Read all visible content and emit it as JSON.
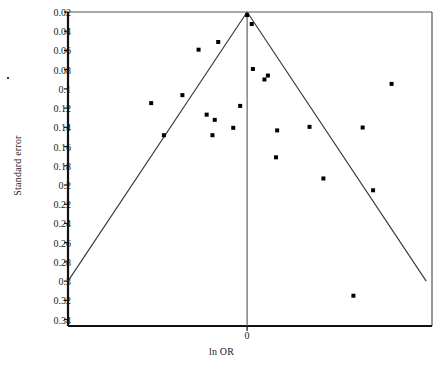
{
  "chart_data": {
    "type": "scatter",
    "title": "",
    "xlabel": "ln OR",
    "ylabel": "Standard error",
    "xlim": [
      -1.55,
      1.6
    ],
    "ylim": [
      0.02,
      0.3467
    ],
    "y_inverted": true,
    "grid": false,
    "legend": null,
    "xticks": [
      {
        "value": 0,
        "label": "0"
      }
    ],
    "yticks": [
      {
        "value": 0.02,
        "label": "0.02"
      },
      {
        "value": 0.04,
        "label": "0.04"
      },
      {
        "value": 0.06,
        "label": "0.06"
      },
      {
        "value": 0.08,
        "label": "0.08"
      },
      {
        "value": 0.1,
        "label": "0.1"
      },
      {
        "value": 0.12,
        "label": "0.12"
      },
      {
        "value": 0.14,
        "label": "0.14"
      },
      {
        "value": 0.16,
        "label": "0.16"
      },
      {
        "value": 0.18,
        "label": "0.18"
      },
      {
        "value": 0.2,
        "label": "0.2"
      },
      {
        "value": 0.22,
        "label": "0.22"
      },
      {
        "value": 0.24,
        "label": "0.24"
      },
      {
        "value": 0.26,
        "label": "0.26"
      },
      {
        "value": 0.28,
        "label": "0.28"
      },
      {
        "value": 0.3,
        "label": "0.3"
      },
      {
        "value": 0.32,
        "label": "0.32"
      },
      {
        "value": 0.34,
        "label": "0.34"
      }
    ],
    "reference_line": {
      "x": 0,
      "label": "0",
      "color": "#555555"
    },
    "funnel_bounds": {
      "apex": {
        "x": 0,
        "y": 0.02
      },
      "left_end": {
        "x": -1.55,
        "y": 0.3
      },
      "right_end": {
        "x": 1.55,
        "y": 0.3
      },
      "color": "#333333"
    },
    "marker": {
      "shape": "square",
      "color": "#000000",
      "size_px": 4
    },
    "points": [
      {
        "x": 0.0,
        "y": 0.0232
      },
      {
        "x": 0.04,
        "y": 0.0325
      },
      {
        "x": -0.25,
        "y": 0.0512
      },
      {
        "x": -0.42,
        "y": 0.0592
      },
      {
        "x": 0.05,
        "y": 0.0793
      },
      {
        "x": 0.18,
        "y": 0.0861
      },
      {
        "x": 0.15,
        "y": 0.0902
      },
      {
        "x": 1.25,
        "y": 0.0948
      },
      {
        "x": -0.56,
        "y": 0.1065
      },
      {
        "x": -0.83,
        "y": 0.1148
      },
      {
        "x": -0.06,
        "y": 0.1177
      },
      {
        "x": -0.35,
        "y": 0.1268
      },
      {
        "x": -0.28,
        "y": 0.1322
      },
      {
        "x": -0.12,
        "y": 0.1405
      },
      {
        "x": 0.26,
        "y": 0.1432
      },
      {
        "x": 0.54,
        "y": 0.1395
      },
      {
        "x": 1.0,
        "y": 0.1402
      },
      {
        "x": -0.72,
        "y": 0.1482
      },
      {
        "x": -0.3,
        "y": 0.1482
      },
      {
        "x": 0.25,
        "y": 0.1712
      },
      {
        "x": 0.66,
        "y": 0.1932
      },
      {
        "x": 1.09,
        "y": 0.2055
      },
      {
        "x": 0.92,
        "y": 0.3152
      }
    ]
  }
}
